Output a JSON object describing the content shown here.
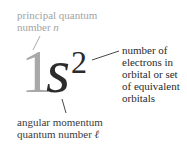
{
  "diagram": {
    "notation": {
      "principal_number": "1",
      "subshell_letter": "s",
      "electron_count": "2"
    },
    "labels": {
      "principal": {
        "line1": "principal quantum",
        "line2_prefix": "number ",
        "symbol": "n"
      },
      "electrons": {
        "lines": [
          "number of",
          "electrons in",
          "orbital or set",
          "of equivalent",
          "orbitals"
        ]
      },
      "angular": {
        "line1": "angular momentum",
        "line2_prefix": "quantum number ",
        "symbol": "ℓ"
      }
    },
    "colors": {
      "principal": "#a8a8a8",
      "main": "#2b2b2b",
      "leader_gray": "#a0a0a0",
      "leader_dark": "#333333"
    }
  }
}
